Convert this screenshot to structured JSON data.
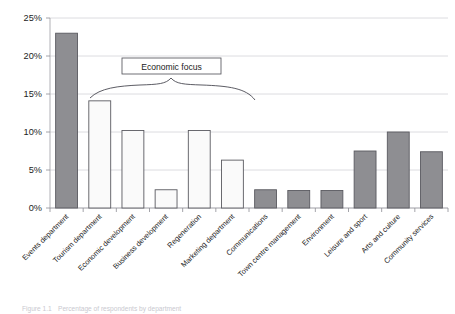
{
  "chart_data": {
    "type": "bar",
    "title": "",
    "subtitle": "",
    "xlabel": "",
    "ylabel": "",
    "ylim": [
      0,
      25
    ],
    "grid": true,
    "legend": null,
    "y_tick_labels": [
      "0%",
      "5%",
      "10%",
      "15%",
      "20%",
      "25%"
    ],
    "y_ticks": [
      0,
      5,
      10,
      15,
      20,
      25
    ],
    "categories": [
      "Events department",
      "Tourism department",
      "Economic development",
      "Business development",
      "Regeneration",
      "Marketing department",
      "Communications",
      "Town centre management",
      "Environment",
      "Leisure and sport",
      "Arts and culture",
      "Community services"
    ],
    "values": [
      23.0,
      14.1,
      10.2,
      2.4,
      10.2,
      6.3,
      2.4,
      2.3,
      2.3,
      7.5,
      10.0,
      7.4
    ],
    "value_unit": "%",
    "bar_styles": [
      "shaded",
      "open",
      "open",
      "open",
      "open",
      "open",
      "shaded",
      "shaded",
      "shaded",
      "shaded",
      "shaded",
      "shaded"
    ],
    "annotations": [
      {
        "text": "Economic focus",
        "type": "brace-label",
        "covers": [
          "Tourism department",
          "Economic development",
          "Business development",
          "Regeneration",
          "Marketing department"
        ]
      }
    ]
  },
  "colors": {
    "bar_shaded_fill": "#8e8e92",
    "bar_open_fill": "#fafafa",
    "bar_edge": "#5a5a60",
    "gridline": "#d3d3d8",
    "axis": "#a8a8ae",
    "text": "#1c1c1c",
    "annotation_stroke": "#4a4a52",
    "caption": "#c9c9cf"
  },
  "caption": {
    "prefix": "Figure 1.1",
    "text": "Percentage of respondents by department"
  }
}
